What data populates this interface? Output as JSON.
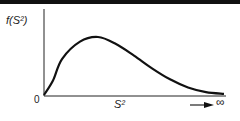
{
  "chart_data": {
    "type": "line",
    "title": "",
    "xlabel": "S²",
    "ylabel": "f(S²)",
    "x_tick_labels": [
      "0"
    ],
    "x_end_annotation": "→ ∞",
    "grid": false,
    "legend": null,
    "series": [
      {
        "name": "f(S²)",
        "description": "right-skewed chi-square-like sampling distribution of variance",
        "x": [
          0,
          0.05,
          0.1,
          0.2,
          0.3,
          0.4,
          0.5,
          0.6,
          0.7,
          0.8,
          0.9,
          1.0
        ],
        "y": [
          0,
          0.25,
          0.62,
          0.92,
          1.0,
          0.88,
          0.68,
          0.46,
          0.27,
          0.13,
          0.05,
          0.02
        ]
      }
    ],
    "xlim": [
      0,
      1.0
    ],
    "ylim": [
      0,
      1.1
    ]
  },
  "labels": {
    "y_axis": "f(S²)",
    "origin": "0",
    "x_axis": "S²",
    "infinity": "∞"
  }
}
